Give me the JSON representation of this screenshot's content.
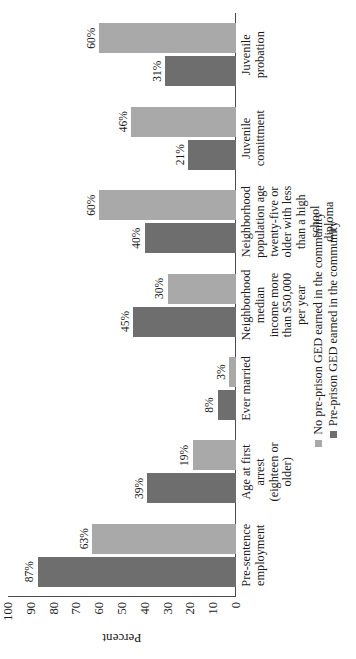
{
  "chart_data": {
    "type": "bar",
    "title": "",
    "xlabel": "",
    "ylabel": "Percent",
    "ylim": [
      0,
      100
    ],
    "ytick_labels": [
      "100",
      "90",
      "80",
      "70",
      "60",
      "50",
      "40",
      "30",
      "20",
      "10",
      "0"
    ],
    "ytick_values": [
      100,
      90,
      80,
      70,
      60,
      50,
      40,
      30,
      20,
      10,
      0
    ],
    "grid": false,
    "legend_position": "bottom",
    "orientation": "vertical-bars-rotated-90ccw",
    "categories": [
      "Pre-sentence employment",
      "Age at first arrest (eighteen or older)",
      "Ever married",
      "Neighborhood median income more than $50,000 per year",
      "Neighborhood population age twenty-five or older with less than a high school diploma",
      "Juvenile comittment",
      "Juvenile probation"
    ],
    "category_lines": [
      [
        "Pre-sentence",
        "employment"
      ],
      [
        "Age at first arrest",
        "(eighteen or older)"
      ],
      [
        "Ever married"
      ],
      [
        "Neighborhood",
        "median",
        "income more",
        "than $50,000",
        "per year"
      ],
      [
        "Neighborhood",
        "population age",
        "twenty-five or",
        "older with less",
        "than a high school",
        "diploma"
      ],
      [
        "Juvenile",
        "comittment"
      ],
      [
        "Juvenile",
        "probation"
      ]
    ],
    "series": [
      {
        "name": "Pre-prison GED earned in the community",
        "color": "#6e6e6e",
        "values": [
          87,
          39,
          8,
          45,
          40,
          21,
          31
        ],
        "value_labels": [
          "87%",
          "39%",
          "8%",
          "45%",
          "40%",
          "21%",
          "31%"
        ]
      },
      {
        "name": "No pre-prison GED earned in the community",
        "color": "#a9a9a9",
        "values": [
          63,
          19,
          3,
          30,
          60,
          46,
          60
        ],
        "value_labels": [
          "63%",
          "19%",
          "3%",
          "30%",
          "60%",
          "46%",
          "60%"
        ]
      }
    ]
  }
}
